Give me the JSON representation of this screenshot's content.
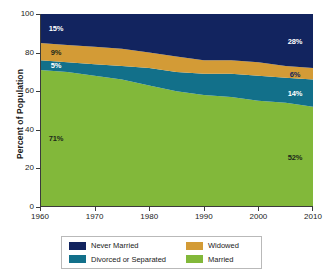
{
  "chart_data": {
    "type": "area",
    "stacked": true,
    "title": "",
    "xlabel": "",
    "ylabel": "Percent of Population",
    "xlim": [
      1960,
      2010
    ],
    "ylim": [
      0,
      100
    ],
    "grid": false,
    "legend_position": "bottom",
    "x_ticks": [
      1960,
      1970,
      1980,
      1990,
      2000,
      2010
    ],
    "y_ticks": [
      0,
      20,
      40,
      60,
      80,
      100
    ],
    "x": [
      1960,
      1965,
      1970,
      1975,
      1980,
      1985,
      1990,
      1995,
      2000,
      2005,
      2010
    ],
    "series": [
      {
        "name": "Married",
        "color": "#82b83a",
        "values": [
          71,
          70,
          68,
          66,
          63,
          60,
          58,
          57,
          55,
          54,
          52
        ]
      },
      {
        "name": "Divorced or Separated",
        "color": "#12708a",
        "values": [
          5,
          5,
          6,
          7,
          9,
          10,
          11,
          12,
          13,
          13,
          14
        ]
      },
      {
        "name": "Widowed",
        "color": "#d39b36",
        "values": [
          9,
          9,
          9,
          9,
          8,
          8,
          7,
          7,
          7,
          6,
          6
        ]
      },
      {
        "name": "Never Married",
        "color": "#12245f",
        "values": [
          15,
          16,
          17,
          18,
          20,
          22,
          24,
          24,
          25,
          27,
          28
        ]
      }
    ],
    "annotations": [
      {
        "text": "15%",
        "series": "Never Married",
        "year": 1960,
        "value": 15,
        "style": "light"
      },
      {
        "text": "9%",
        "series": "Widowed",
        "year": 1960,
        "value": 9,
        "style": "dark"
      },
      {
        "text": "5%",
        "series": "Divorced or Separated",
        "year": 1960,
        "value": 5,
        "style": "light"
      },
      {
        "text": "71%",
        "series": "Married",
        "year": 1960,
        "value": 71,
        "style": "dark"
      },
      {
        "text": "28%",
        "series": "Never Married",
        "year": 2010,
        "value": 28,
        "style": "light"
      },
      {
        "text": "6%",
        "series": "Widowed",
        "year": 2010,
        "value": 6,
        "style": "navy"
      },
      {
        "text": "14%",
        "series": "Divorced or Separated",
        "year": 2010,
        "value": 14,
        "style": "light"
      },
      {
        "text": "52%",
        "series": "Married",
        "year": 2010,
        "value": 52,
        "style": "dark"
      }
    ]
  },
  "axes": {
    "y_title": "Percent of Population",
    "y_tick_labels": [
      "0",
      "20",
      "40",
      "60",
      "80",
      "100"
    ],
    "x_tick_labels": [
      "1960",
      "1970",
      "1980",
      "1990",
      "2000",
      "2010"
    ]
  },
  "legend": {
    "items": [
      {
        "label": "Never Married",
        "color": "#12245f"
      },
      {
        "label": "Widowed",
        "color": "#d39b36"
      },
      {
        "label": "Divorced or Separated",
        "color": "#12708a"
      },
      {
        "label": "Married",
        "color": "#82b83a"
      }
    ]
  }
}
